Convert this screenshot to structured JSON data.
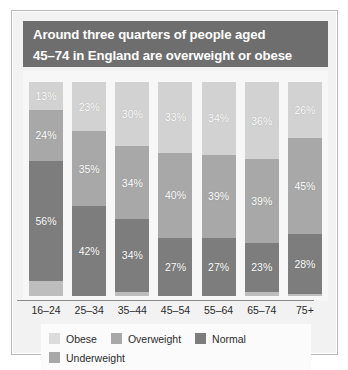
{
  "title": {
    "line1": "Around three quarters of people aged",
    "line2": "45–74 in England are overweight or obese"
  },
  "colors": {
    "title_band": "#6e6e6e",
    "obese": "#d2d2d2",
    "overweight": "#a8a8a8",
    "normal": "#7d7d7d",
    "underweight": "#bdbdbd",
    "plot_background": "#f7f7f7",
    "figure_background": "#f2f2f2",
    "legend_background": "#fbfbfb",
    "axis_line": "#8c8c8c",
    "frame_border": "#b9b9b9"
  },
  "legend": {
    "row1": [
      {
        "label": "Obese",
        "key": "obese"
      },
      {
        "label": "Overweight",
        "key": "overweight"
      },
      {
        "label": "Normal",
        "key": "normal"
      }
    ],
    "row2": [
      {
        "label": "Underweight",
        "key": "underweight"
      }
    ]
  },
  "chart_data": {
    "type": "bar",
    "subtype": "stacked-100-percent",
    "title": "Around three quarters of people aged 45–74 in England are overweight or obese",
    "xlabel": "",
    "ylabel": "",
    "ylim": [
      0,
      100
    ],
    "grid": false,
    "legend_position": "bottom",
    "value_suffix": "%",
    "stack_order_top_to_bottom": [
      "Obese",
      "Overweight",
      "Normal",
      "Underweight"
    ],
    "categories": [
      "16–24",
      "25–34",
      "35–44",
      "45–54",
      "55–64",
      "65–74",
      "75+"
    ],
    "series": [
      {
        "name": "Obese",
        "values": [
          13,
          23,
          30,
          33,
          34,
          36,
          26
        ]
      },
      {
        "name": "Overweight",
        "values": [
          24,
          35,
          34,
          40,
          39,
          39,
          45
        ]
      },
      {
        "name": "Normal",
        "values": [
          56,
          42,
          34,
          27,
          27,
          23,
          28
        ]
      },
      {
        "name": "Underweight",
        "values": [
          7,
          0,
          2,
          0,
          0,
          2,
          1
        ]
      }
    ],
    "labels": {
      "16–24": {
        "Obese": "13%",
        "Overweight": "24%",
        "Normal": "56%",
        "Underweight": ""
      },
      "25–34": {
        "Obese": "23%",
        "Overweight": "35%",
        "Normal": "42%",
        "Underweight": ""
      },
      "35–44": {
        "Obese": "30%",
        "Overweight": "34%",
        "Normal": "34%",
        "Underweight": ""
      },
      "45–54": {
        "Obese": "33%",
        "Overweight": "40%",
        "Normal": "27%",
        "Underweight": ""
      },
      "55–64": {
        "Obese": "34%",
        "Overweight": "39%",
        "Normal": "27%",
        "Underweight": ""
      },
      "65–74": {
        "Obese": "36%",
        "Overweight": "39%",
        "Normal": "23%",
        "Underweight": ""
      },
      "75+": {
        "Obese": "26%",
        "Overweight": "45%",
        "Normal": "28%",
        "Underweight": ""
      }
    }
  }
}
